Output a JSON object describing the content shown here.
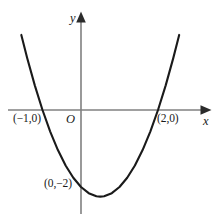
{
  "figure": {
    "title": "",
    "background_color": "#ffffff",
    "width": 220,
    "height": 221
  },
  "axes": {
    "color": "#808080",
    "x_axis_label": "x",
    "y_axis_label": "y",
    "origin_label": "O",
    "origin_pixel": {
      "x": 81,
      "y": 110
    },
    "x_arrow_name": "x-axis-arrowhead",
    "y_arrow_name": "y-axis-arrowhead"
  },
  "labels": {
    "root_left": "(−1,0)",
    "root_right": "(2,0)",
    "y_intercept": "(0,−2)"
  },
  "chart_data": {
    "type": "line",
    "title": "",
    "xlabel": "x",
    "ylabel": "y",
    "curve_color": "#1a1a1a",
    "grid": false,
    "legend": "none",
    "xlim": [
      -2.1,
      3.38
    ],
    "ylim": [
      -2.88,
      2.55
    ],
    "function": "y = x^2 - x - 2",
    "roots": [
      -1,
      2
    ],
    "y_intercept": -2,
    "vertex": [
      0.5,
      -2.25
    ],
    "annotations": [
      {
        "text": "(−1,0)",
        "x": -1,
        "y": 0
      },
      {
        "text": "(2,0)",
        "x": 2,
        "y": 0
      },
      {
        "text": "(0,−2)",
        "x": 0,
        "y": -2
      }
    ],
    "x": [
      -1.55,
      -1.4,
      -1.2,
      -1.0,
      -0.8,
      -0.6,
      -0.4,
      -0.2,
      0.0,
      0.2,
      0.4,
      0.5,
      0.6,
      0.8,
      1.0,
      1.2,
      1.4,
      1.6,
      1.8,
      2.0,
      2.2,
      2.4,
      2.55
    ],
    "y": [
      1.95,
      1.36,
      0.64,
      0.0,
      -0.56,
      -1.04,
      -1.44,
      -1.76,
      -2.0,
      -2.16,
      -2.24,
      -2.25,
      -2.24,
      -2.16,
      -2.0,
      -1.76,
      -1.44,
      -1.04,
      -0.56,
      0.0,
      0.64,
      1.36,
      1.95
    ]
  }
}
